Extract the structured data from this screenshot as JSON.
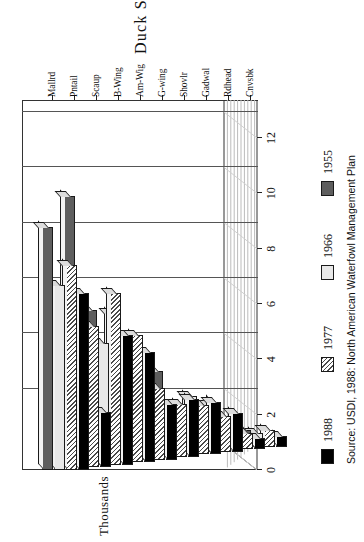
{
  "chart_data": {
    "type": "bar",
    "subtype": "grouped-3d-horizontal",
    "title": "",
    "xlabel": "Duck Species",
    "ylabel": "Thousands",
    "ylim": [
      0,
      12
    ],
    "yticks": [
      "12",
      "10",
      "8",
      "6",
      "4",
      "2",
      "0"
    ],
    "grid": true,
    "legend_position": "below",
    "categories": [
      "Mallrd",
      "Pntail",
      "Scaup",
      "B-Wing",
      "Am-Wig",
      "G-wing",
      "Shovlr",
      "Gadwal",
      "Rdhead",
      "Cnvsbk"
    ],
    "series": [
      {
        "name": "1988",
        "color": "#000000",
        "pattern": "solid-black",
        "values": [
          6.4,
          2.0,
          4.7,
          4.0,
          2.0,
          2.1,
          1.9,
          1.4,
          0.4,
          0.4
        ]
      },
      {
        "name": "1977",
        "color": "#4a4a4a",
        "pattern": "diagonal-hatch",
        "values": [
          7.4,
          5.1,
          6.2,
          4.6,
          2.6,
          1.9,
          1.8,
          1.3,
          0.6,
          0.6
        ]
      },
      {
        "name": "1966",
        "color": "#e8e8e8",
        "pattern": "light-gray",
        "values": [
          6.7,
          4.8,
          4.4,
          3.7,
          2.3,
          1.7,
          2.1,
          1.7,
          0.7,
          0.5
        ]
      },
      {
        "name": "1955",
        "color": "#5e5e5e",
        "pattern": "dark-gray",
        "values": [
          8.8,
          9.8,
          5.6,
          5.4,
          3.2,
          3.1,
          1.6,
          0.8,
          0.8,
          0.6
        ]
      }
    ]
  },
  "axes": {
    "y_title": "Thousands",
    "x_title": "Duck Species"
  },
  "legend": {
    "entries": [
      {
        "label": "1988"
      },
      {
        "label": "1977"
      },
      {
        "label": "1966"
      },
      {
        "label": "1955"
      }
    ]
  },
  "source": {
    "text": "Source: USDI, 1988: North American Waterfowl Management Plan"
  }
}
